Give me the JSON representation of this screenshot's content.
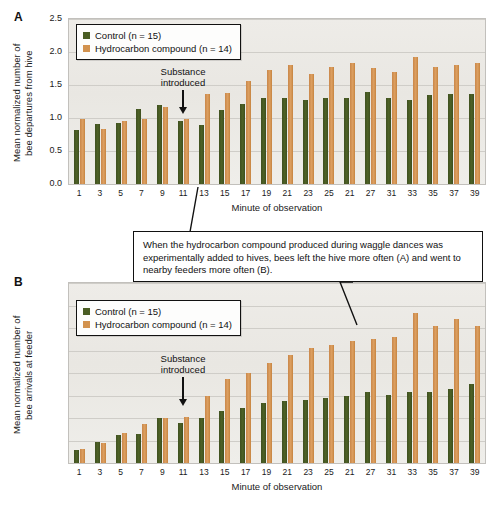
{
  "figure": {
    "callout_text": "When the hydrocarbon compound produced during waggle dances was experimentally added to hives, bees left the hive more often (A) and went to nearby feeders more often (B)."
  },
  "legend": {
    "control_label": "Control (n = 15)",
    "treatment_label": "Hydrocarbon compound (n = 14)",
    "control_color": "#4a5d23",
    "treatment_color": "#d2924e"
  },
  "annotation": {
    "substance_introduced": "Substance\nintroduced"
  },
  "panelA": {
    "letter": "A",
    "ylabel": "Mean normalized number of\nbee departures from hive",
    "xlabel": "Minute of observation"
  },
  "panelB": {
    "letter": "B",
    "ylabel": "Mean normalized number of\nbee arrivals at feeder",
    "xlabel": "Minute of observation"
  },
  "chart_data": [
    {
      "type": "bar",
      "panel": "A",
      "title": "",
      "xlabel": "Minute of observation",
      "ylabel": "Mean normalized number of bee departures from hive",
      "ylim": [
        0.0,
        2.5
      ],
      "yticks": [
        "0.0",
        "0.5",
        "1.0",
        "1.5",
        "2.0",
        "2.5"
      ],
      "grid": true,
      "legend_position": "top-left",
      "categories": [
        "1",
        "3",
        "5",
        "7",
        "9",
        "11",
        "13",
        "15",
        "17",
        "19",
        "21",
        "23",
        "25",
        "21",
        "27",
        "31",
        "33",
        "35",
        "37",
        "39"
      ],
      "series": [
        {
          "name": "Control (n = 15)",
          "color": "#4a5d23",
          "values": [
            0.82,
            0.91,
            0.92,
            1.14,
            1.2,
            0.95,
            0.9,
            1.12,
            1.21,
            1.3,
            1.3,
            1.27,
            1.3,
            1.31,
            1.4,
            1.31,
            1.27,
            1.35,
            1.37,
            1.36
          ]
        },
        {
          "name": "Hydrocarbon compound (n = 14)",
          "color": "#d2924e",
          "values": [
            0.99,
            0.83,
            0.96,
            0.99,
            1.17,
            0.99,
            1.37,
            1.38,
            1.56,
            1.72,
            1.8,
            1.67,
            1.78,
            1.83,
            1.76,
            1.7,
            1.92,
            1.77,
            1.8,
            1.83
          ]
        }
      ],
      "annotations": [
        {
          "text": "Substance introduced",
          "at_category": "11",
          "type": "arrow-down"
        }
      ]
    },
    {
      "type": "bar",
      "panel": "B",
      "title": "",
      "xlabel": "Minute of observation",
      "ylabel": "Mean normalized number of bee arrivals at feeder",
      "ylim": [
        0.0,
        4.0
      ],
      "yticks": [
        "0.0",
        "0.5",
        "1.0",
        "1.5",
        "2.0",
        "2.5",
        "3.0",
        "3.5",
        "4.0"
      ],
      "grid": true,
      "legend_position": "top-left",
      "categories": [
        "1",
        "3",
        "5",
        "7",
        "9",
        "11",
        "13",
        "15",
        "17",
        "19",
        "21",
        "23",
        "25",
        "21",
        "27",
        "31",
        "33",
        "35",
        "37",
        "39"
      ],
      "series": [
        {
          "name": "Control (n = 15)",
          "color": "#4a5d23",
          "values": [
            0.3,
            0.46,
            0.63,
            0.65,
            1.0,
            0.9,
            0.99,
            1.16,
            1.23,
            1.33,
            1.37,
            1.4,
            1.44,
            1.5,
            1.58,
            1.52,
            1.57,
            1.58,
            1.64,
            1.76
          ]
        },
        {
          "name": "Hydrocarbon compound (n = 14)",
          "color": "#d2924e",
          "values": [
            0.32,
            0.44,
            0.66,
            0.86,
            1.01,
            1.03,
            1.5,
            1.87,
            2.01,
            2.22,
            2.4,
            2.56,
            2.62,
            2.72,
            2.75,
            2.8,
            3.33,
            3.05,
            3.21,
            3.04
          ]
        }
      ],
      "annotations": [
        {
          "text": "Substance introduced",
          "at_category": "11",
          "type": "arrow-down"
        }
      ]
    }
  ]
}
